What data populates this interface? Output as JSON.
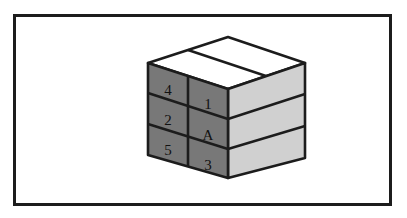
{
  "figure": {
    "kind": "isometric-block-diagram",
    "frame": {
      "border_color": "#1c1c1c",
      "background_color": "#ffffff"
    },
    "faces": {
      "top": {
        "name": "top-face",
        "color": "#ffffff",
        "edge_color": "#1c1c1c",
        "divisions": 2
      },
      "left": {
        "name": "left-front-face",
        "color": "#787878",
        "edge_color": "#1c1c1c",
        "columns": 2,
        "rows": 3
      },
      "right": {
        "name": "right-side-face",
        "color": "#d0d0d0",
        "edge_color": "#1c1c1c",
        "rows": 3
      }
    },
    "cells": [
      {
        "id": "cell-r1c1",
        "label": "4",
        "row": 1,
        "column": 1
      },
      {
        "id": "cell-r1c2",
        "label": "1",
        "row": 1,
        "column": 2
      },
      {
        "id": "cell-r2c1",
        "label": "2",
        "row": 2,
        "column": 1
      },
      {
        "id": "cell-r2c2",
        "label": "A",
        "row": 2,
        "column": 2
      },
      {
        "id": "cell-r3c1",
        "label": "5",
        "row": 3,
        "column": 1
      },
      {
        "id": "cell-r3c2",
        "label": "3",
        "row": 3,
        "column": 2
      }
    ],
    "labels": {
      "r1c1": "4",
      "r1c2": "1",
      "r2c1": "2",
      "r2c2": "A",
      "r3c1": "5",
      "r3c2": "3"
    }
  }
}
